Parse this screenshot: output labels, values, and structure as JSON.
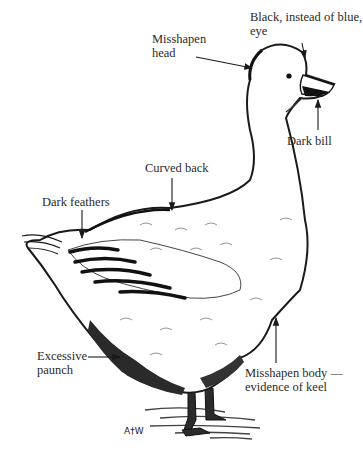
{
  "diagram": {
    "signature": "A†W",
    "labels": [
      {
        "id": "eye",
        "lines": [
          "Black, instead of blue,",
          "eye"
        ]
      },
      {
        "id": "head",
        "lines": [
          "Misshapen",
          "head"
        ]
      },
      {
        "id": "bill",
        "lines": [
          "Dark bill"
        ]
      },
      {
        "id": "back",
        "lines": [
          "Curved back"
        ]
      },
      {
        "id": "feathers",
        "lines": [
          "Dark feathers"
        ]
      },
      {
        "id": "paunch",
        "lines": [
          "Excessive",
          "paunch"
        ]
      },
      {
        "id": "body",
        "lines": [
          "Misshapen body —",
          "evidence of keel"
        ]
      }
    ],
    "colors": {
      "ink": "#1a1a1a",
      "paper": "#ffffff",
      "label": "#2a2a2a"
    }
  }
}
